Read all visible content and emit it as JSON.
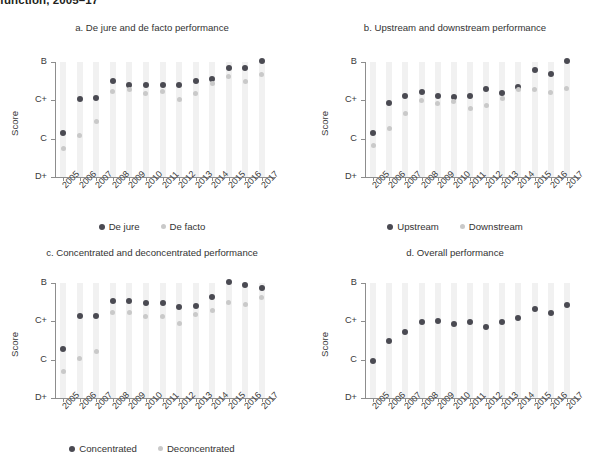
{
  "figure": {
    "title": "function, 2005–17",
    "y_axis_label": "Score",
    "y_tick_labels": [
      "D+",
      "C",
      "C+",
      "B"
    ],
    "years": [
      "2005",
      "2006",
      "2007",
      "2008",
      "2009",
      "2010",
      "2011",
      "2012",
      "2013",
      "2014",
      "2015",
      "2016",
      "2017"
    ],
    "colors": {
      "series_dark": "#4a4a52",
      "series_light": "#c9c9c9",
      "grid": "#f1f1f1",
      "axis": "#8d8d8d"
    }
  },
  "panels": [
    {
      "id": "a",
      "title": "a. De jure and de facto performance",
      "legend": [
        "De jure",
        "De facto"
      ]
    },
    {
      "id": "b",
      "title": "b. Upstream and downstream performance",
      "legend": [
        "Upstream",
        "Downstream"
      ]
    },
    {
      "id": "c",
      "title": "c. Concentrated and deconcentrated performance",
      "legend": [
        "Concentrated",
        "Deconcentrated"
      ]
    },
    {
      "id": "d",
      "title": "d. Overall performance",
      "legend": []
    }
  ],
  "chart_data": [
    {
      "type": "scatter",
      "panel": "a",
      "title": "a. De jure and de facto performance",
      "xlabel": "",
      "ylabel": "Score",
      "x": [
        "2005",
        "2006",
        "2007",
        "2008",
        "2009",
        "2010",
        "2011",
        "2012",
        "2013",
        "2014",
        "2015",
        "2016",
        "2017"
      ],
      "ylim": [
        0,
        3
      ],
      "ytick_labels": [
        "D+",
        "C",
        "C+",
        "B"
      ],
      "ytick_values": [
        0,
        1,
        2,
        3
      ],
      "grid": true,
      "legend_position": "bottom",
      "series": [
        {
          "name": "De jure",
          "color": "#4a4a52",
          "values": [
            1.15,
            2.04,
            2.06,
            2.5,
            2.4,
            2.4,
            2.41,
            2.4,
            2.5,
            2.56,
            2.85,
            2.85,
            3.03
          ]
        },
        {
          "name": "De facto",
          "color": "#c9c9c9",
          "values": [
            0.75,
            1.09,
            1.45,
            2.24,
            2.29,
            2.18,
            2.22,
            2.01,
            2.17,
            2.45,
            2.62,
            2.5,
            2.67
          ]
        }
      ]
    },
    {
      "type": "scatter",
      "panel": "b",
      "title": "b. Upstream and downstream performance",
      "xlabel": "",
      "ylabel": "Score",
      "x": [
        "2005",
        "2006",
        "2007",
        "2008",
        "2009",
        "2010",
        "2011",
        "2012",
        "2013",
        "2014",
        "2015",
        "2016",
        "2017"
      ],
      "ylim": [
        0,
        3
      ],
      "ytick_labels": [
        "D+",
        "C",
        "C+",
        "B"
      ],
      "ytick_values": [
        0,
        1,
        2,
        3
      ],
      "grid": true,
      "legend_position": "bottom",
      "series": [
        {
          "name": "Upstream",
          "color": "#4a4a52",
          "values": [
            1.15,
            1.93,
            2.12,
            2.22,
            2.12,
            2.08,
            2.11,
            2.29,
            2.2,
            2.36,
            2.78,
            2.68,
            3.02
          ]
        },
        {
          "name": "Downstream",
          "color": "#c9c9c9",
          "values": [
            0.82,
            1.26,
            1.66,
            1.99,
            1.92,
            1.98,
            1.8,
            1.87,
            2.04,
            2.28,
            2.28,
            2.2,
            2.32
          ]
        }
      ]
    },
    {
      "type": "scatter",
      "panel": "c",
      "title": "c. Concentrated and deconcentrated performance",
      "xlabel": "",
      "ylabel": "Score",
      "x": [
        "2005",
        "2006",
        "2007",
        "2008",
        "2009",
        "2010",
        "2011",
        "2012",
        "2013",
        "2014",
        "2015",
        "2016",
        "2017"
      ],
      "ylim": [
        0,
        3
      ],
      "ytick_labels": [
        "D+",
        "C",
        "C+",
        "B"
      ],
      "ytick_values": [
        0,
        1,
        2,
        3
      ],
      "grid": true,
      "legend_position": "bottom",
      "series": [
        {
          "name": "Concentrated",
          "color": "#4a4a52",
          "values": [
            1.29,
            2.14,
            2.15,
            2.53,
            2.53,
            2.48,
            2.48,
            2.38,
            2.41,
            2.64,
            3.02,
            2.94,
            2.88
          ]
        },
        {
          "name": "Deconcentrated",
          "color": "#c9c9c9",
          "values": [
            0.7,
            1.03,
            1.21,
            2.23,
            2.22,
            2.13,
            2.13,
            1.95,
            2.17,
            2.29,
            2.5,
            2.45,
            2.62
          ]
        }
      ]
    },
    {
      "type": "scatter",
      "panel": "d",
      "title": "d. Overall performance",
      "xlabel": "",
      "ylabel": "Score",
      "x": [
        "2005",
        "2006",
        "2007",
        "2008",
        "2009",
        "2010",
        "2011",
        "2012",
        "2013",
        "2014",
        "2015",
        "2016",
        "2017"
      ],
      "ylim": [
        0,
        3
      ],
      "ytick_labels": [
        "D+",
        "C",
        "C+",
        "B"
      ],
      "ytick_values": [
        0,
        1,
        2,
        3
      ],
      "grid": true,
      "legend_position": "none",
      "series": [
        {
          "name": "Overall",
          "color": "#4a4a52",
          "values": [
            0.97,
            1.5,
            1.72,
            1.97,
            2.01,
            1.92,
            1.97,
            1.85,
            1.99,
            2.08,
            2.33,
            2.23,
            2.42
          ]
        }
      ]
    }
  ]
}
